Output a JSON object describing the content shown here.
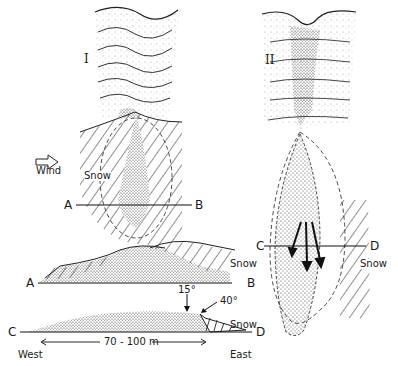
{
  "figure": {
    "panel_I": {
      "label": "I",
      "wind_label": "Wind",
      "snow_label": "Snow",
      "section_start": "A",
      "section_end": "B"
    },
    "panel_II": {
      "label": "II",
      "snow_label": "Snow",
      "section_start": "C",
      "section_end": "D"
    },
    "profile_AB": {
      "start": "A",
      "end": "B",
      "snow_label": "Snow"
    },
    "profile_CD": {
      "start": "C",
      "end": "D",
      "angle_low": "15°",
      "angle_high": "40°",
      "snow_label": "Snow",
      "length_label": "70 - 100 m",
      "west_label": "West",
      "east_label": "East"
    }
  }
}
